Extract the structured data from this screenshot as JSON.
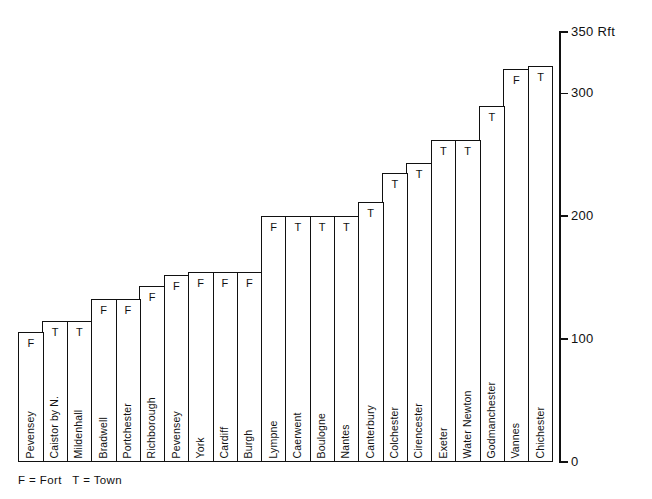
{
  "chart_data": {
    "type": "bar",
    "title": "",
    "subtitle": "",
    "xlabel": "",
    "ylabel": "Rft",
    "unit": "Rft",
    "ylim": [
      0,
      350
    ],
    "yticks": [
      0,
      100,
      200,
      300,
      350
    ],
    "ytick_labels": [
      "0",
      "100",
      "200",
      "300",
      "350"
    ],
    "grid": false,
    "axis_position": "right",
    "legend_position": "bottom-left",
    "legend_text": "F = Fort   T = Town",
    "legend_entries": [
      {
        "key": "F",
        "label": "Fort"
      },
      {
        "key": "T",
        "label": "Town"
      }
    ],
    "categories": [
      "Pevensey",
      "Caistor by N.",
      "Mildenhall",
      "Bradwell",
      "Portchester",
      "Richborough",
      "Pevensey",
      "York",
      "Cardiff",
      "Burgh",
      "Lympne",
      "Caerwent",
      "Boulogne",
      "Nantes",
      "Canterbury",
      "Colchester",
      "Cirencester",
      "Exeter",
      "Water Newton",
      "Godmanchester",
      "Vannes",
      "Chichester"
    ],
    "values": [
      106,
      115,
      115,
      133,
      133,
      143,
      152,
      155,
      155,
      155,
      200,
      200,
      200,
      200,
      212,
      235,
      243,
      262,
      262,
      290,
      320,
      322
    ],
    "markers": [
      "F",
      "T",
      "T",
      "F",
      "F",
      "F",
      "F",
      "F",
      "F",
      "F",
      "F",
      "T",
      "T",
      "T",
      "T",
      "T",
      "T",
      "T",
      "T",
      "T",
      "F",
      "T"
    ],
    "series": [
      {
        "name": "Circuit length",
        "values": [
          106,
          115,
          115,
          133,
          133,
          143,
          152,
          155,
          155,
          155,
          200,
          200,
          200,
          200,
          212,
          235,
          243,
          262,
          262,
          290,
          320,
          322
        ]
      }
    ]
  },
  "colors": {
    "ink": "#111111",
    "background": "#ffffff",
    "bar_fill": "#ffffff",
    "bar_stroke": "#111111"
  }
}
